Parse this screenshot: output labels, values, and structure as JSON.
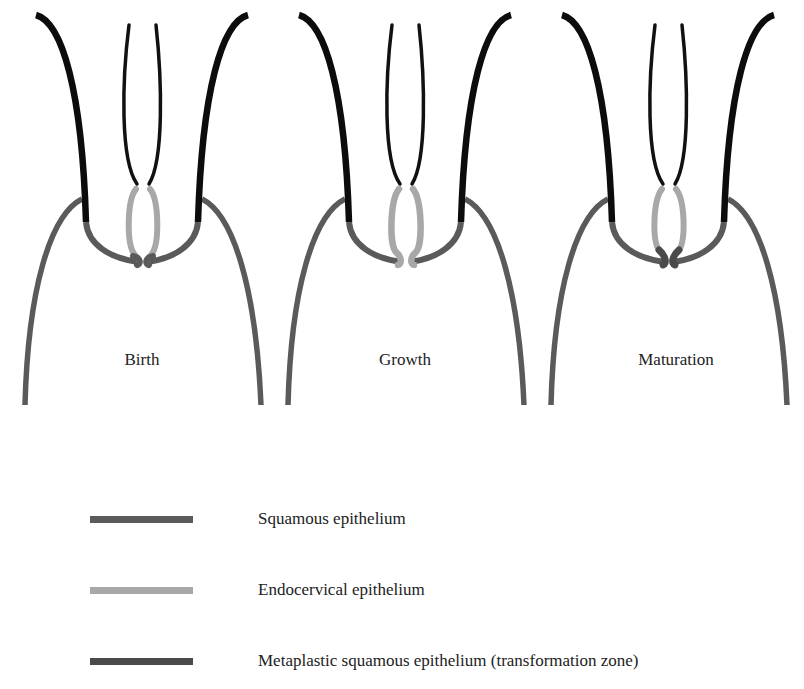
{
  "colors": {
    "squamous": "#5a5a5a",
    "endocervical": "#a8a8a8",
    "metaplastic": "#4a4a4a",
    "outer_black": "#0c0c0c",
    "canal_black": "#111111"
  },
  "panels": [
    {
      "id": "birth",
      "label": "Birth"
    },
    {
      "id": "growth",
      "label": "Growth"
    },
    {
      "id": "maturation",
      "label": "Maturation"
    }
  ],
  "legend": [
    {
      "label": "Squamous epithelium",
      "color": "#5a5a5a"
    },
    {
      "label": "Endocervical epithelium",
      "color": "#a8a8a8"
    },
    {
      "label": "Metaplastic squamous epithelium (transformation zone)",
      "color": "#4a4a4a"
    }
  ]
}
